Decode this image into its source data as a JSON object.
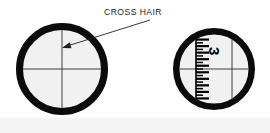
{
  "figure": {
    "background_color": "#ffffff",
    "ring_color": "#0b0b0b",
    "lens_color": "#f1f1f1",
    "hairline_color": "#2b2b2b",
    "label_color": "#231f20"
  },
  "callout": {
    "label": "CROSS HAIR",
    "text_x": 104,
    "text_y": 15,
    "leader": {
      "start_x": 150,
      "start_y": 20,
      "end_x": 64,
      "end_y": 47
    },
    "arrow_tip_x": 62,
    "arrow_tip_y": 48
  },
  "reticles": [
    {
      "name": "plain-crosshair-reticle",
      "label": "Plain cross hair eyepiece view",
      "center_x": 62,
      "center_y": 69,
      "outer_radius": 46,
      "ring_thickness": 7,
      "has_scale": false,
      "crosshair": {
        "vertical_x": 62,
        "horizontal_y": 69
      },
      "scale": null
    },
    {
      "name": "graduated-scale-reticle",
      "label": "Cross hair with graduated measuring scale",
      "center_x": 214,
      "center_y": 69,
      "outer_radius": 41,
      "ring_thickness": 6.5,
      "has_scale": true,
      "crosshair": {
        "vertical_x": 232,
        "horizontal_y": 69
      },
      "scale": {
        "axis_x": 196,
        "top_y": 32,
        "bottom_y": 107,
        "numeral": "3",
        "numeral_x": 209,
        "numeral_y": 47,
        "numeral_rotation_deg": 90,
        "tick_count": 19,
        "major_tick_length": 13,
        "minor_tick_length": 7,
        "major_every": 2
      }
    }
  ]
}
